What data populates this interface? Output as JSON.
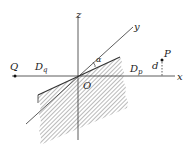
{
  "diagram": {
    "axes": {
      "x_label": "x",
      "y_label": "y",
      "z_label": "z"
    },
    "origin_label": "O",
    "angle_label": "α",
    "points": {
      "Q": "Q",
      "P": "P"
    },
    "regions": {
      "Dq": "D",
      "Dq_sub": "q",
      "Dp": "D",
      "Dp_sub": "p"
    },
    "distance_label": "d",
    "colors": {
      "line": "#333333",
      "hatch": "#555555",
      "background": "#ffffff"
    }
  }
}
